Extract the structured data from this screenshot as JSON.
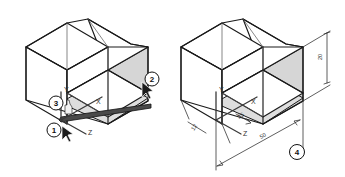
{
  "figure": {
    "background_color": "#ffffff",
    "line_color": "#1a1a1a",
    "shaded_face_color": "#d6d6d6",
    "width": 345,
    "height": 177
  },
  "panels": [
    {
      "id": "left-panel",
      "name": "left-isometric-view",
      "description": "L-shaped isometric block with selected edge highlighted and coordinate triad",
      "callouts": [
        {
          "id": "callout-1",
          "label": "1",
          "cx": 54,
          "cy": 130
        },
        {
          "id": "callout-2",
          "label": "2",
          "cx": 152,
          "cy": 79
        },
        {
          "id": "callout-3",
          "label": "3",
          "cx": 56,
          "cy": 103
        }
      ],
      "axis_triad": {
        "name": "coordinate-triad",
        "labels": {
          "x": "X",
          "y": "Y",
          "z": "Z"
        }
      },
      "cursors": [
        {
          "id": "cursor-arrow-2",
          "type": "arrow-cursor"
        },
        {
          "id": "cursor-arrow-1",
          "type": "arrow-cursor"
        },
        {
          "id": "cursor-hand-3",
          "type": "hand-cursor"
        }
      ]
    },
    {
      "id": "right-panel",
      "name": "right-isometric-view",
      "description": "Same L-shaped isometric block annotated with linear dimensions",
      "callouts": [
        {
          "id": "callout-4",
          "label": "4",
          "cx": 297,
          "cy": 152
        }
      ],
      "axis_triad": {
        "name": "coordinate-triad",
        "labels": {
          "x": "X",
          "y": "Y",
          "z": "Z"
        }
      },
      "dimensions": [
        {
          "id": "dim-height",
          "label": "20",
          "orientation": "vertical-right"
        },
        {
          "id": "dim-depth",
          "label": "12",
          "orientation": "oblique-left"
        },
        {
          "id": "dim-short",
          "label": "25",
          "orientation": "oblique-center"
        },
        {
          "id": "dim-length",
          "label": "50",
          "orientation": "oblique-bottom"
        }
      ]
    }
  ]
}
